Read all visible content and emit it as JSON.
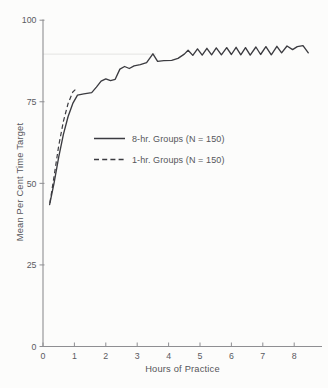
{
  "figure": {
    "background": "#fcfcfb",
    "text_color": "#55555a",
    "axis_color": "#8e8e92",
    "line_color": "#3b3b40",
    "reference_line_color": "#e4e4e2"
  },
  "chart_data": {
    "type": "line",
    "title": "",
    "xlabel": "Hours of Practice",
    "ylabel": "Mean Per Cent Time Target",
    "xlim": [
      0,
      8.9
    ],
    "ylim": [
      0,
      100
    ],
    "x_ticks": [
      0,
      1,
      2,
      3,
      4,
      5,
      6,
      7,
      8
    ],
    "y_ticks": [
      0,
      25,
      50,
      75,
      100
    ],
    "grid": "off",
    "reference_line": {
      "y": 89.6,
      "x_start": 0,
      "x_end": 3.6
    },
    "legend_position": "inside-left-center",
    "series": [
      {
        "name": "8-hr. Groups (N = 150)",
        "style": "solid",
        "points": [
          [
            0.21,
            43.5
          ],
          [
            0.35,
            50.0
          ],
          [
            0.5,
            58.0
          ],
          [
            0.65,
            65.0
          ],
          [
            0.8,
            70.5
          ],
          [
            0.95,
            74.5
          ],
          [
            1.1,
            77.0
          ],
          [
            1.3,
            77.4
          ],
          [
            1.55,
            77.8
          ],
          [
            1.7,
            79.5
          ],
          [
            1.85,
            81.3
          ],
          [
            2.0,
            82.0
          ],
          [
            2.15,
            81.5
          ],
          [
            2.3,
            81.9
          ],
          [
            2.45,
            85.0
          ],
          [
            2.6,
            85.8
          ],
          [
            2.75,
            85.2
          ],
          [
            2.9,
            86.0
          ],
          [
            3.1,
            86.4
          ],
          [
            3.3,
            87.0
          ],
          [
            3.5,
            89.7
          ],
          [
            3.65,
            87.4
          ],
          [
            3.85,
            87.6
          ],
          [
            4.1,
            87.7
          ],
          [
            4.3,
            88.3
          ],
          [
            4.5,
            89.6
          ],
          [
            4.62,
            90.8
          ],
          [
            4.77,
            89.2
          ],
          [
            4.92,
            91.2
          ],
          [
            5.07,
            89.3
          ],
          [
            5.22,
            91.4
          ],
          [
            5.37,
            89.4
          ],
          [
            5.52,
            91.5
          ],
          [
            5.68,
            89.4
          ],
          [
            5.85,
            91.6
          ],
          [
            6.0,
            89.5
          ],
          [
            6.15,
            91.7
          ],
          [
            6.3,
            89.4
          ],
          [
            6.45,
            91.6
          ],
          [
            6.6,
            89.3
          ],
          [
            6.78,
            91.8
          ],
          [
            6.93,
            89.5
          ],
          [
            7.1,
            91.9
          ],
          [
            7.27,
            89.4
          ],
          [
            7.45,
            92.0
          ],
          [
            7.6,
            90.0
          ],
          [
            7.77,
            92.1
          ],
          [
            7.95,
            91.0
          ],
          [
            8.1,
            91.9
          ],
          [
            8.28,
            92.2
          ],
          [
            8.45,
            90.0
          ]
        ]
      },
      {
        "name": "1-hr. Groups (N = 150)",
        "style": "dashed",
        "points": [
          [
            0.22,
            44.0
          ],
          [
            0.35,
            52.0
          ],
          [
            0.5,
            61.5
          ],
          [
            0.65,
            69.0
          ],
          [
            0.8,
            74.5
          ],
          [
            0.95,
            78.0
          ],
          [
            1.1,
            79.3
          ]
        ]
      }
    ]
  }
}
